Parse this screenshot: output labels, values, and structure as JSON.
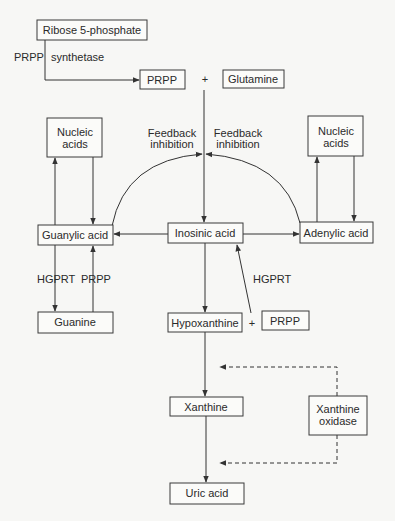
{
  "colors": {
    "background": "#f7f7f5",
    "line": "#333333",
    "text": "#2a2a2a",
    "box_fill": "#fbfbf9"
  },
  "nodes": {
    "ribose": "Ribose 5-phosphate",
    "prpp_top": "PRPP",
    "plus_top": "+",
    "glutamine": "Glutamine",
    "nucleic_left_1": "Nucleic",
    "nucleic_left_2": "acids",
    "nucleic_right_1": "Nucleic",
    "nucleic_right_2": "acids",
    "guanylic": "Guanylic acid",
    "inosinic": "Inosinic acid",
    "adenylic": "Adenylic acid",
    "guanine": "Guanine",
    "hypoxanthine": "Hypoxanthine",
    "plus_mid": "+",
    "prpp_mid": "PRPP",
    "xanthine": "Xanthine",
    "xo_1": "Xanthine",
    "xo_2": "oxidase",
    "uric": "Uric acid"
  },
  "labels": {
    "prpp_synth_a": "PRPP",
    "prpp_synth_b": "synthetase",
    "feedback_left_1": "Feedback",
    "feedback_left_2": "inhibition",
    "feedback_right_1": "Feedback",
    "feedback_right_2": "inhibition",
    "hgprt_left": "HGPRT",
    "prpp_left": "PRPP",
    "hgprt_mid": "HGPRT"
  }
}
